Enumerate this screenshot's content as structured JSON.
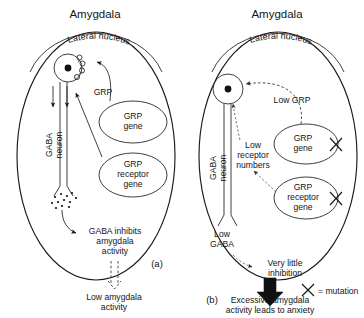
{
  "figure": {
    "type": "biological-mechanism-diagram"
  },
  "panel_a": {
    "id": "(a)",
    "title": "Amygdala",
    "subtitle": "Lateral nucleus",
    "labels": {
      "grp": "GRP",
      "grp_gene": "GRP\ngene",
      "grp_gene_line1": "GRP",
      "grp_gene_line2": "gene",
      "grp_receptor_gene_line1": "GRP",
      "grp_receptor_gene_line2": "receptor",
      "grp_receptor_gene_line3": "gene",
      "gaba_neuron_line1": "GABA",
      "gaba_neuron_line2": "neuron",
      "inhibits_line1": "GABA inhibits",
      "inhibits_line2": "amygdala",
      "inhibits_line3": "activity",
      "outcome_line1": "Low amygdala",
      "outcome_line2": "activity"
    }
  },
  "panel_b": {
    "id": "(b)",
    "title": "Amygdala",
    "subtitle": "Lateral nucleus",
    "labels": {
      "low_grp_line1": "Low GRP",
      "grp_gene_line1": "GRP",
      "grp_gene_line2": "gene",
      "grp_receptor_gene_line1": "GRP",
      "grp_receptor_gene_line2": "receptor",
      "grp_receptor_gene_line3": "gene",
      "low_receptor_line1": "Low",
      "low_receptor_line2": "receptor",
      "low_receptor_line3": "numbers",
      "gaba_neuron_line1": "GABA",
      "gaba_neuron_line2": "neuron",
      "low_gaba_line1": "Low",
      "low_gaba_line2": "GABA",
      "very_little_line1": "Very little",
      "very_little_line2": "inhibition",
      "outcome_line1": "Excessive amygdala",
      "outcome_line2": "activity leads to anxiety",
      "legend": "= mutation"
    }
  },
  "colors": {
    "ink": "#1a1a1a",
    "background": "#ffffff",
    "dashed": "#3a3a3a"
  }
}
